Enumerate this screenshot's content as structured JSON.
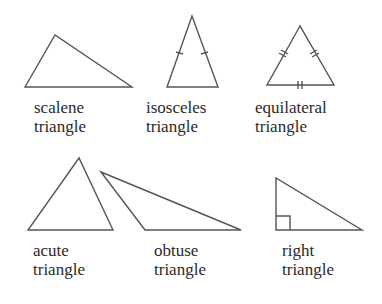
{
  "diagram": {
    "stroke_color": "#555555",
    "triangles": [
      {
        "id": "scalene",
        "label_line1": "scalene",
        "label_line2": "triangle",
        "marks": "none"
      },
      {
        "id": "isosceles",
        "label_line1": "isosceles",
        "label_line2": "triangle",
        "marks": "single tick on both legs"
      },
      {
        "id": "equilateral",
        "label_line1": "equilateral",
        "label_line2": "triangle",
        "marks": "double tick on all three sides"
      },
      {
        "id": "acute",
        "label_line1": "acute",
        "label_line2": "triangle",
        "marks": "none"
      },
      {
        "id": "obtuse",
        "label_line1": "obtuse",
        "label_line2": "triangle",
        "marks": "none"
      },
      {
        "id": "right",
        "label_line1": "right",
        "label_line2": "triangle",
        "marks": "right-angle square"
      }
    ]
  }
}
